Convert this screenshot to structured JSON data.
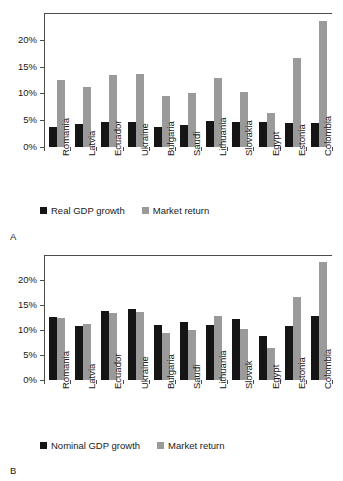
{
  "figure": {
    "background": "#ffffff",
    "series_colors": {
      "gdp": "#151515",
      "market": "#9a9a9a"
    }
  },
  "panels": [
    {
      "letter": "A",
      "legend": [
        {
          "label": "Real GDP growth",
          "color": "#151515"
        },
        {
          "label": "Market return",
          "color": "#9a9a9a"
        }
      ]
    },
    {
      "letter": "B",
      "legend": [
        {
          "label": "Nominal GDP growth",
          "color": "#151515"
        },
        {
          "label": "Market return",
          "color": "#9a9a9a"
        }
      ]
    }
  ],
  "chart_data": [
    {
      "type": "bar",
      "panel": "A",
      "title": "",
      "xlabel": "",
      "ylabel": "",
      "ylim": [
        0,
        25
      ],
      "yticks": [
        0,
        5,
        10,
        15,
        20
      ],
      "ytick_labels": [
        "0%",
        "5%",
        "10%",
        "15%",
        "20%"
      ],
      "grid": false,
      "legend_position": "bottom",
      "categories": [
        "Romania",
        "Latvia",
        "Ecuador",
        "Ukraine",
        "Bulgaria",
        "Saudi",
        "Lithuania",
        "Slovakia",
        "Egypt",
        "Estonia",
        "Colombia"
      ],
      "series": [
        {
          "name": "Real GDP growth",
          "color": "#151515",
          "values": [
            3.7,
            4.3,
            4.6,
            4.7,
            3.8,
            4.2,
            4.8,
            4.7,
            4.7,
            4.4,
            4.4
          ]
        },
        {
          "name": "Market return",
          "color": "#9a9a9a",
          "values": [
            12.5,
            11.2,
            13.5,
            13.7,
            9.5,
            10.0,
            12.8,
            10.2,
            6.4,
            16.6,
            23.6
          ]
        }
      ]
    },
    {
      "type": "bar",
      "panel": "B",
      "title": "",
      "xlabel": "",
      "ylabel": "",
      "ylim": [
        0,
        25
      ],
      "yticks": [
        0,
        5,
        10,
        15,
        20
      ],
      "ytick_labels": [
        "0%",
        "5%",
        "10%",
        "15%",
        "20%"
      ],
      "grid": false,
      "legend_position": "bottom",
      "categories": [
        "Romania",
        "Latvia",
        "Ecuador",
        "Ukraine",
        "Bulgaria",
        "Saudi",
        "Lithuania",
        "Slovak",
        "Egypt",
        "Estonia",
        "Colombia"
      ],
      "series": [
        {
          "name": "Nominal GDP growth",
          "color": "#151515",
          "values": [
            12.7,
            10.9,
            13.9,
            14.3,
            11.0,
            11.6,
            11.0,
            12.3,
            8.9,
            10.8,
            12.8
          ]
        },
        {
          "name": "Market return",
          "color": "#9a9a9a",
          "values": [
            12.5,
            11.2,
            13.5,
            13.7,
            9.5,
            10.0,
            12.8,
            10.2,
            6.4,
            16.6,
            23.6
          ]
        }
      ]
    }
  ]
}
